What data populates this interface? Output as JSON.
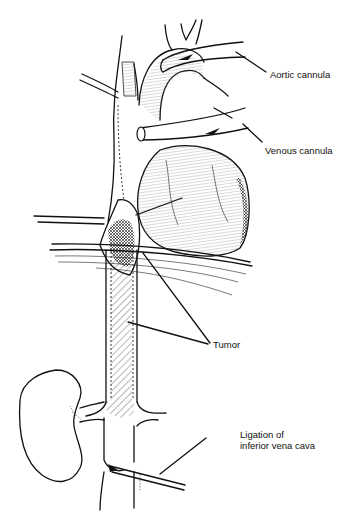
{
  "figure": {
    "labels": {
      "aortic_cannula": "Aortic cannula",
      "venous_cannula": "Venous cannula",
      "tumor": "Tumor",
      "ligation_line1": "Ligation of",
      "ligation_line2": "inferior vena cava"
    },
    "colors": {
      "background": "#ffffff",
      "ink": "#111111"
    }
  }
}
